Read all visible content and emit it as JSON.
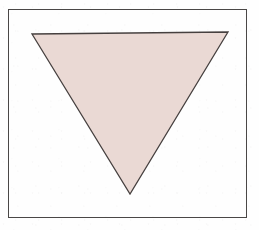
{
  "figure": {
    "canvas": {
      "width": 259,
      "height": 230,
      "background_color": "#fefefe",
      "medium": "scanned line drawing"
    },
    "frame": {
      "name": "rectangular border",
      "shape": "rectangle",
      "x": 8,
      "y": 9,
      "width": 239,
      "height": 209,
      "stroke_color": "#4a4746",
      "stroke_width": 1,
      "fill": "none"
    },
    "shapes": [
      {
        "name": "inverted-triangle",
        "type": "triangle",
        "orientation": "point-down",
        "vertices": [
          {
            "label": "top-left",
            "x": 32,
            "y": 34
          },
          {
            "label": "top-right",
            "x": 228,
            "y": 32
          },
          {
            "label": "apex",
            "x": 130,
            "y": 194
          }
        ],
        "points_string": "32,34 228,32 130,194",
        "fill_color": "#ead9d4",
        "stroke_color": "#46403f",
        "stroke_width": 1.3,
        "base_length_px": 196,
        "height_px": 161
      }
    ],
    "palette": {
      "paper_white": "#fefefe",
      "shape_fill_pink": "#ead9d4",
      "outline_charcoal": "#46403f",
      "frame_gray": "#4a4746"
    },
    "labels": {
      "caption": "",
      "annotations": []
    }
  }
}
